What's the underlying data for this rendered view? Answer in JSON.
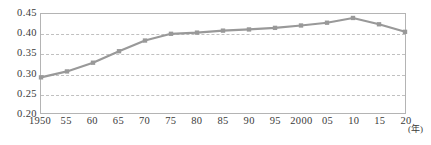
{
  "chart_data": {
    "type": "line",
    "title": "",
    "xlabel": "(年)",
    "ylabel": "",
    "categories": [
      "1950",
      "55",
      "60",
      "65",
      "70",
      "75",
      "80",
      "85",
      "90",
      "95",
      "2000",
      "05",
      "10",
      "15",
      "20"
    ],
    "x": [
      1950,
      1955,
      1960,
      1965,
      1970,
      1975,
      1980,
      1985,
      1990,
      1995,
      2000,
      2005,
      2010,
      2015,
      2020
    ],
    "values": [
      0.29,
      0.305,
      0.327,
      0.356,
      0.383,
      0.4,
      0.403,
      0.408,
      0.411,
      0.415,
      0.421,
      0.428,
      0.44,
      0.424,
      0.405
    ],
    "ylim": [
      0.2,
      0.45
    ],
    "ytick_labels": [
      "0.45",
      "0.40",
      "0.35",
      "0.30",
      "0.25",
      "0.20"
    ],
    "ytick_values": [
      0.45,
      0.4,
      0.35,
      0.3,
      0.25,
      0.2
    ],
    "grid": true,
    "legend": false,
    "legend_position": "none",
    "series_color": "#999999",
    "marker": "square",
    "axis_color": "#b4b4b4",
    "grid_color": "#c0c0c0",
    "text_color": "#3a3a3a"
  }
}
